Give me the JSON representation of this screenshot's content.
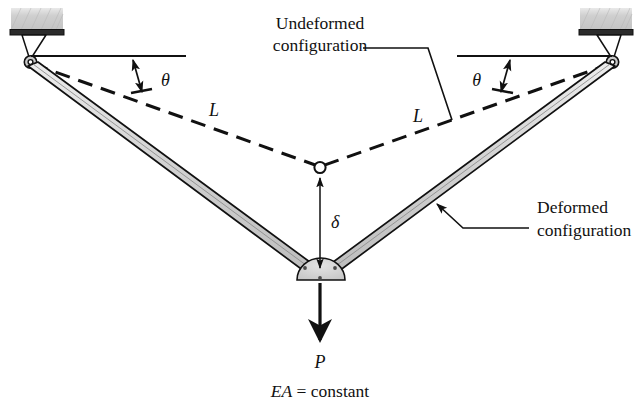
{
  "figure": {
    "background_color": "#ffffff",
    "line_color": "#111111",
    "bar_fill_color": "#cfcfcf",
    "gusset_fill_color": "#d2d2d2",
    "support_hatch_color": "#c9c9c9"
  },
  "labels": {
    "undeformed_line1": "Undeformed",
    "undeformed_line2": "configuration",
    "deformed_line1": "Deformed",
    "deformed_line2": "configuration",
    "length_left": "L",
    "length_right": "L",
    "angle_left": "θ",
    "angle_right": "θ",
    "deflection": "δ",
    "load": "P",
    "note_italic": "EA",
    "note_rest": " = constant"
  },
  "geometry": {
    "left_pin": {
      "x": 30,
      "y": 62
    },
    "right_pin": {
      "x": 613,
      "y": 62
    },
    "undeformed_apex": {
      "x": 320,
      "y": 167
    },
    "deformed_apex": {
      "x": 320,
      "y": 272
    },
    "horizontal_ref_left_end_x": 184,
    "horizontal_ref_right_start_x": 459,
    "horizontal_ref_y": 56,
    "angle_theta_degrees": 10.2,
    "load_arrow_tip_y": 338,
    "delta_top_y": 180,
    "delta_bottom_y": 266
  }
}
